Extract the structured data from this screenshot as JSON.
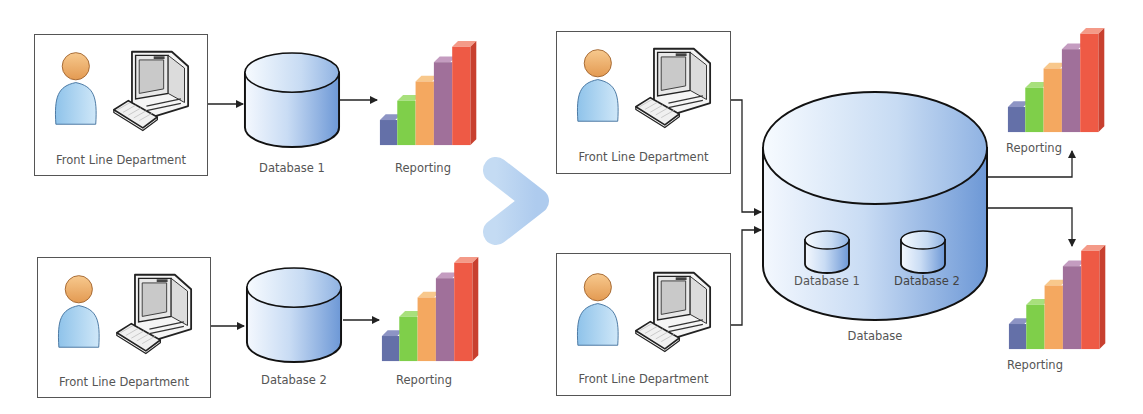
{
  "diagram": {
    "before": {
      "rows": [
        {
          "department": {
            "label": "Front Line Department"
          },
          "database": {
            "label": "Database 1"
          },
          "reporting": {
            "label": "Reporting"
          }
        },
        {
          "department": {
            "label": "Front Line Department"
          },
          "database": {
            "label": "Database 2"
          },
          "reporting": {
            "label": "Reporting"
          }
        }
      ]
    },
    "transition_arrow": {
      "icon": "chevron-right-arrow-icon",
      "color": "#b9d3f0"
    },
    "after": {
      "departments": [
        {
          "label": "Front Line Department"
        },
        {
          "label": "Front Line Department"
        }
      ],
      "central_database": {
        "label": "Database",
        "inner": [
          {
            "label": "Database 1"
          },
          {
            "label": "Database 2"
          }
        ]
      },
      "reporting": [
        {
          "label": "Reporting"
        },
        {
          "label": "Reporting"
        }
      ]
    },
    "colors": {
      "bar_blue": "#6470a8",
      "bar_green": "#7fcf4a",
      "bar_orange": "#f4a860",
      "bar_purple": "#a0709a",
      "bar_red": "#ee5a45",
      "cylinder_light": "#eef5fd",
      "cylinder_dark": "#7ea6dc",
      "person_head": "#f0b070",
      "person_body": "#a9d2f0"
    }
  }
}
